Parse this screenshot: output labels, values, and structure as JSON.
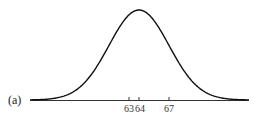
{
  "panel_label": "(a)",
  "chart_data": {
    "type": "line",
    "title": "",
    "mean": 64,
    "x_ticks": [
      63,
      64,
      67
    ],
    "tick_labels": [
      "63",
      "64",
      "67"
    ],
    "xlabel": "",
    "ylabel": "",
    "grid": false
  }
}
